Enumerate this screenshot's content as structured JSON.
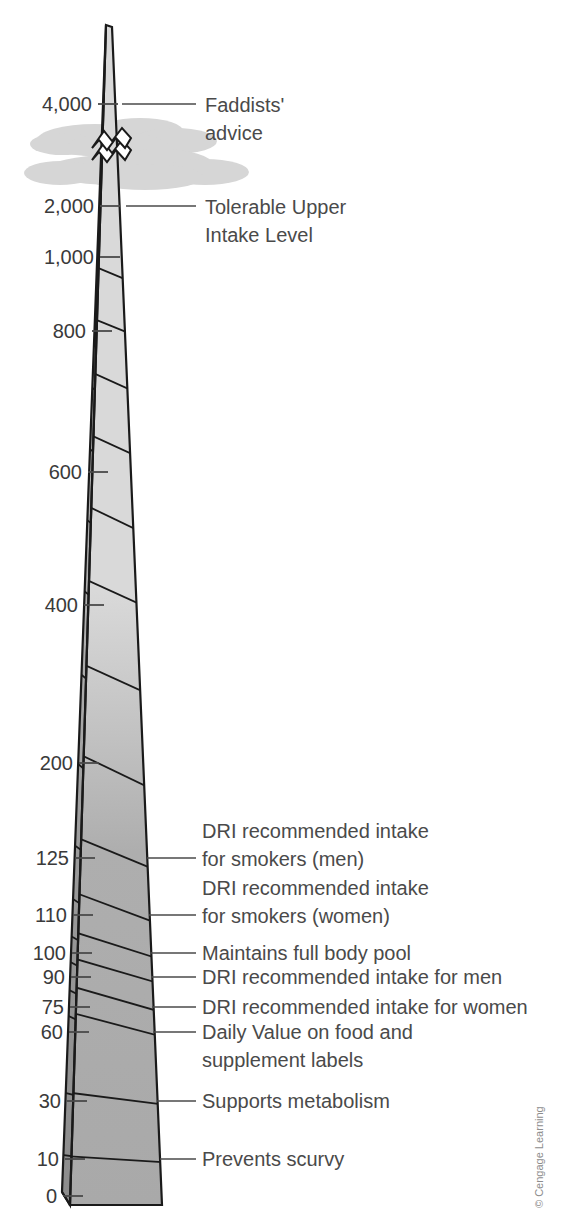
{
  "figure": {
    "credit": "© Cengage Learning",
    "colors": {
      "front_upper": "#d9d9d9",
      "front_lower": "#a9a9a9",
      "side_upper": "#b5b5b5",
      "side_lower": "#8c8c8c",
      "outline": "#1a1a1a",
      "cloud": "#d5d5d5",
      "text": "#4a4a4a",
      "background": "#ffffff"
    }
  },
  "chart_data": {
    "type": "bar",
    "xlabel": "",
    "ylabel": "Vitamin C (mg)",
    "grid": false,
    "legend": "none",
    "scale_note": "Non-linear (compressed) vertical scale; axis broken between 2,000 and 4,000",
    "ylim": [
      0,
      4000
    ],
    "categories": [
      "Prevents scurvy",
      "Supports metabolism",
      "Daily Value on food and supplement labels",
      "DRI recommended intake for women",
      "DRI recommended intake for men",
      "Maintains full body pool",
      "DRI recommended intake for smokers (women)",
      "DRI recommended intake for smokers (men)",
      "Tolerable Upper Intake Level",
      "Faddists' advice"
    ],
    "values": [
      10,
      30,
      60,
      75,
      90,
      100,
      110,
      125,
      2000,
      4000
    ],
    "tick_labels": [
      "0",
      "10",
      "30",
      "60",
      "75",
      "90",
      "100",
      "110",
      "125",
      "200",
      "400",
      "600",
      "800",
      "1,000",
      "2,000",
      "4,000"
    ],
    "tick_values": [
      0,
      10,
      30,
      60,
      75,
      90,
      100,
      110,
      125,
      200,
      400,
      600,
      800,
      1000,
      2000,
      4000
    ]
  },
  "axis": {
    "ticks": [
      {
        "label": "4,000",
        "y": 104,
        "tick_x1": 98,
        "tick_x2": 118,
        "label_x": 92
      },
      {
        "label": "2,000",
        "y": 206,
        "tick_x1": 100,
        "tick_x2": 120,
        "label_x": 94
      },
      {
        "label": "1,000",
        "y": 257,
        "tick_x1": 100,
        "tick_x2": 120,
        "label_x": 94
      },
      {
        "label": "800",
        "y": 331,
        "tick_x1": 92,
        "tick_x2": 112,
        "label_x": 86
      },
      {
        "label": "600",
        "y": 472,
        "tick_x1": 88,
        "tick_x2": 108,
        "label_x": 82
      },
      {
        "label": "400",
        "y": 605,
        "tick_x1": 84,
        "tick_x2": 104,
        "label_x": 78
      },
      {
        "label": "200",
        "y": 763,
        "tick_x1": 79,
        "tick_x2": 99,
        "label_x": 73
      },
      {
        "label": "125",
        "y": 858,
        "tick_x1": 75,
        "tick_x2": 95,
        "label_x": 69
      },
      {
        "label": "110",
        "y": 915,
        "tick_x1": 73,
        "tick_x2": 93,
        "label_x": 67
      },
      {
        "label": "100",
        "y": 953,
        "tick_x1": 72,
        "tick_x2": 92,
        "label_x": 66
      },
      {
        "label": "90",
        "y": 977,
        "tick_x1": 71,
        "tick_x2": 91,
        "label_x": 65
      },
      {
        "label": "75",
        "y": 1007,
        "tick_x1": 70,
        "tick_x2": 90,
        "label_x": 64
      },
      {
        "label": "60",
        "y": 1032,
        "tick_x1": 69,
        "tick_x2": 89,
        "label_x": 63
      },
      {
        "label": "30",
        "y": 1101,
        "tick_x1": 67,
        "tick_x2": 87,
        "label_x": 61
      },
      {
        "label": "10",
        "y": 1159,
        "tick_x1": 65,
        "tick_x2": 85,
        "label_x": 59
      },
      {
        "label": "0",
        "y": 1196,
        "tick_x1": 63,
        "tick_x2": 83,
        "label_x": 57
      }
    ]
  },
  "callouts": [
    {
      "id": "faddists",
      "lines": [
        "Faddists'",
        "advice"
      ],
      "y": 104,
      "leader_x1": 122,
      "leader_x2": 196,
      "text_x": 205,
      "text_y": 112
    },
    {
      "id": "ul",
      "lines": [
        "Tolerable Upper",
        "Intake Level"
      ],
      "y": 206,
      "leader_x1": 126,
      "leader_x2": 196,
      "text_x": 205,
      "text_y": 214
    },
    {
      "id": "smokers-men",
      "lines": [
        "DRI recommended intake",
        "for smokers (men)"
      ],
      "y": 858,
      "leader_x1": 147,
      "leader_x2": 196,
      "text_x": 202,
      "text_y": 838
    },
    {
      "id": "smokers-women",
      "lines": [
        "DRI recommended intake",
        "for smokers (women)"
      ],
      "y": 915,
      "leader_x1": 149,
      "leader_x2": 196,
      "text_x": 202,
      "text_y": 895
    },
    {
      "id": "body-pool",
      "lines": [
        "Maintains full body pool"
      ],
      "y": 953,
      "leader_x1": 150,
      "leader_x2": 196,
      "text_x": 202,
      "text_y": 960
    },
    {
      "id": "dri-men",
      "lines": [
        "DRI recommended intake for men"
      ],
      "y": 977,
      "leader_x1": 151,
      "leader_x2": 196,
      "text_x": 202,
      "text_y": 984
    },
    {
      "id": "dri-women",
      "lines": [
        "DRI recommended intake for women"
      ],
      "y": 1007,
      "leader_x1": 152,
      "leader_x2": 196,
      "text_x": 202,
      "text_y": 1014
    },
    {
      "id": "daily-value",
      "lines": [
        "Daily Value on food and",
        "supplement labels"
      ],
      "y": 1032,
      "leader_x1": 153,
      "leader_x2": 196,
      "text_x": 202,
      "text_y": 1039
    },
    {
      "id": "metabolism",
      "lines": [
        "Supports metabolism"
      ],
      "y": 1101,
      "leader_x1": 157,
      "leader_x2": 196,
      "text_x": 202,
      "text_y": 1108
    },
    {
      "id": "scurvy",
      "lines": [
        "Prevents scurvy"
      ],
      "y": 1159,
      "leader_x1": 160,
      "leader_x2": 196,
      "text_x": 202,
      "text_y": 1166
    }
  ]
}
